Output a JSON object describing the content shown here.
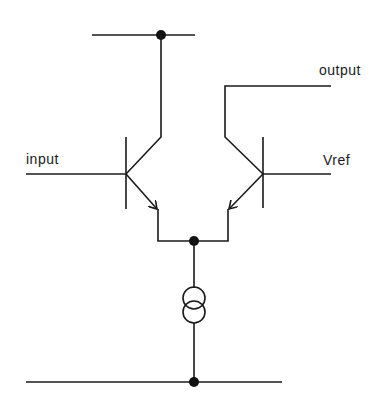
{
  "diagram": {
    "type": "differential-pair-circuit",
    "labels": {
      "input": "input",
      "output": "output",
      "vref": "Vref"
    },
    "components": [
      {
        "id": "Q1",
        "kind": "npn-transistor",
        "base": "input",
        "collector": "top-rail",
        "emitter": "tail-node"
      },
      {
        "id": "Q2",
        "kind": "npn-transistor",
        "base": "Vref",
        "collector": "output",
        "emitter": "tail-node"
      },
      {
        "id": "I1",
        "kind": "current-source",
        "from": "tail-node",
        "to": "bottom-rail"
      }
    ],
    "nodes": [
      "top-rail-junction",
      "tail-node",
      "bottom-rail-junction"
    ],
    "colors": {
      "line": "#1a1a1a",
      "background": "#ffffff"
    }
  }
}
